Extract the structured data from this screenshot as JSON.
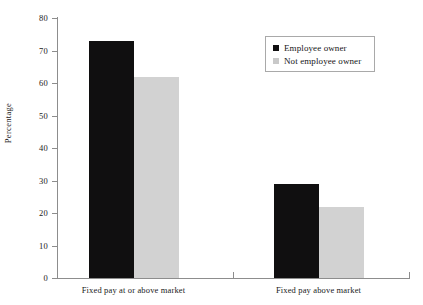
{
  "chart_data": {
    "type": "bar",
    "title": "",
    "xlabel": "",
    "ylabel": "Percentage",
    "ylim": [
      0,
      80
    ],
    "ytick_step": 10,
    "yticks": [
      80,
      70,
      60,
      50,
      40,
      30,
      20,
      10,
      0
    ],
    "ytick_labels": [
      "80",
      "70",
      "60",
      "50",
      "40",
      "30",
      "20",
      "10",
      "0"
    ],
    "categories": [
      "Fixed pay at or above market",
      "Fixed pay above market"
    ],
    "series": [
      {
        "name": "Employee owner",
        "values": [
          73,
          29
        ],
        "color": "#100f10"
      },
      {
        "name": "Not employee owner",
        "values": [
          62,
          22
        ],
        "color": "#d2d2d2"
      }
    ],
    "grid": false,
    "legend_position": "top-right",
    "data_labels_shown": false
  },
  "legend": {
    "entries": [
      {
        "label": "Employee owner",
        "swatch": "legend-swatch-dark"
      },
      {
        "label": "Not employee owner",
        "swatch": "legend-swatch-light"
      }
    ]
  }
}
